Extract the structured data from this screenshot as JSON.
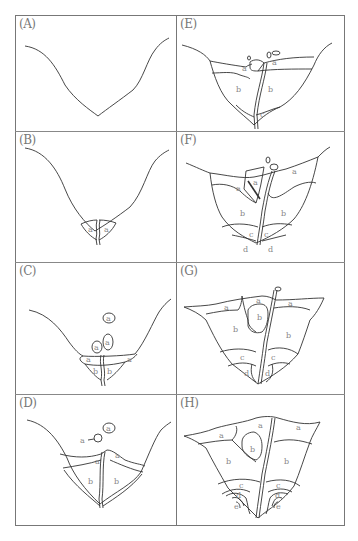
{
  "figure": {
    "panels": [
      {
        "id": "A",
        "label": "(A)",
        "layer_labels": []
      },
      {
        "id": "B",
        "label": "(B)",
        "layer_labels": [
          "a",
          "a"
        ]
      },
      {
        "id": "C",
        "label": "(C)",
        "layer_labels": [
          "a",
          "a",
          "a",
          "a",
          "a",
          "b",
          "b"
        ]
      },
      {
        "id": "D",
        "label": "(D)",
        "layer_labels": [
          "a",
          "a",
          "a",
          "a",
          "b",
          "b"
        ]
      },
      {
        "id": "E",
        "label": "(E)",
        "layer_labels": [
          "a",
          "a",
          "b",
          "b",
          "c"
        ]
      },
      {
        "id": "F",
        "label": "(F)",
        "layer_labels": [
          "a",
          "a",
          "a",
          "b",
          "b",
          "c",
          "c",
          "d",
          "d"
        ]
      },
      {
        "id": "G",
        "label": "(G)",
        "layer_labels": [
          "a",
          "a",
          "a",
          "b",
          "b",
          "b",
          "c",
          "c",
          "d",
          "d"
        ]
      },
      {
        "id": "H",
        "label": "(H)",
        "layer_labels": [
          "a",
          "a",
          "a",
          "b",
          "b",
          "b",
          "c",
          "c",
          "d",
          "d",
          "e",
          "e"
        ]
      }
    ],
    "line_color": "#333333",
    "label_color": "#888888",
    "frame_color": "#777777"
  }
}
